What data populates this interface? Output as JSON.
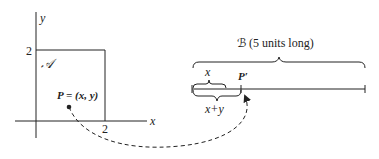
{
  "left_figure": {
    "y_axis_label": "y",
    "x_axis_label": "x",
    "y_tick": "2",
    "x_tick": "2",
    "region_label": "𝒜",
    "point_label": "P = (x, y)"
  },
  "right_figure": {
    "segment_label": "ℬ (5 units long)",
    "x_brace_label": "x",
    "xy_brace_label": "x+y",
    "image_point_label": "P′"
  },
  "colors": {
    "ink": "#222222",
    "background": "#ffffff"
  }
}
